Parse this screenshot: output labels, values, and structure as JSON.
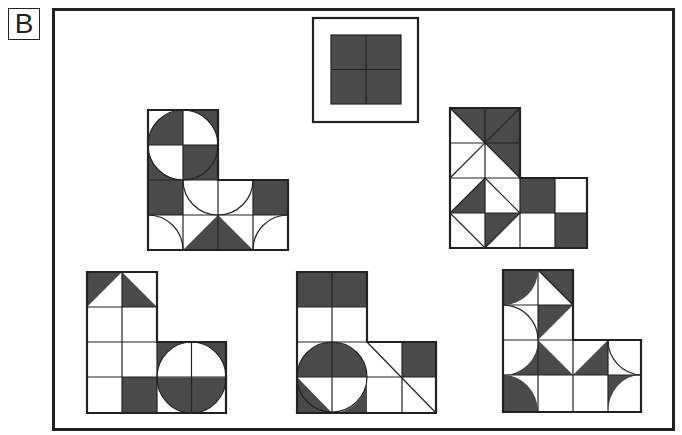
{
  "puzzle": {
    "label": "B",
    "reference": {
      "description": "2x2 grid of dark squares inside a framed box",
      "fill": "#4a4a4a"
    },
    "colors": {
      "dark": "#4a4a4a",
      "line": "#222222",
      "background": "#ffffff"
    },
    "options": [
      {
        "id": "shape-1",
        "position": "top-left",
        "description": "L-shape with quartered circle on top 2x2, half circles and triangles on bottom rows"
      },
      {
        "id": "shape-2",
        "position": "top-right",
        "description": "L-shape with diagonal triangles in upper 2x2 and checker squares at bottom right"
      },
      {
        "id": "shape-3",
        "position": "bottom-left",
        "description": "L-shape with two triangles at top and a half-shaded circle at bottom right"
      },
      {
        "id": "shape-4",
        "position": "bottom-middle",
        "description": "L-shape with two dark squares on top, circle at bottom left and diagonal line at bottom right"
      },
      {
        "id": "shape-5",
        "position": "bottom-right",
        "description": "L-shape with quarter arcs and triangles"
      }
    ]
  }
}
